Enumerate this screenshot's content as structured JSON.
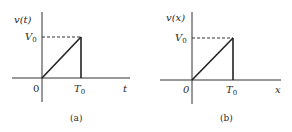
{
  "figures": [
    {
      "id": "a",
      "y_label_func": "v",
      "y_label_var": "t",
      "y_level_main": "V",
      "y_level_sub": "0",
      "origin_label": "0",
      "x_tick_main": "T",
      "x_tick_sub": "0",
      "x_axis_label": "t",
      "caption": "(a)"
    },
    {
      "id": "b",
      "y_label_func": "v",
      "y_label_var": "x",
      "y_level_main": "V",
      "y_level_sub": "0",
      "origin_label": "0",
      "x_tick_main": "T",
      "x_tick_sub": "0",
      "x_axis_label": "x",
      "caption": "(b)"
    }
  ],
  "colors": {
    "line": "#222222",
    "background": "#ffffff"
  }
}
